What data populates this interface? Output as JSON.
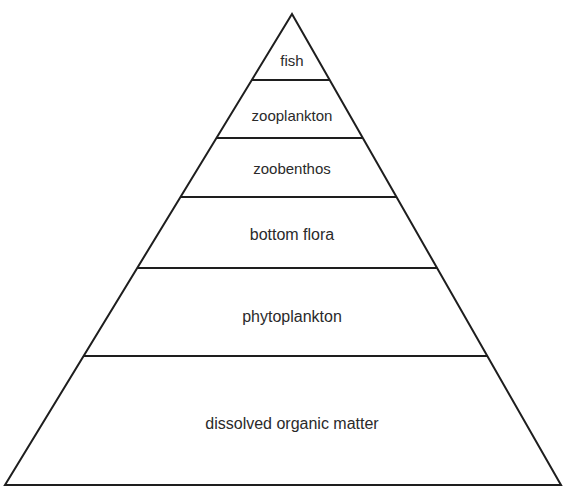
{
  "diagram": {
    "type": "pyramid",
    "apex": [
      292,
      14
    ],
    "base": {
      "y": 485,
      "left": 5,
      "right": 561
    },
    "line_color": "#1e1e1e",
    "levels": [
      {
        "label": "fish",
        "top": 14,
        "bottom": 80,
        "text_y": 66,
        "font_size": 15
      },
      {
        "label": "zooplankton",
        "top": 80,
        "bottom": 138,
        "text_y": 121,
        "font_size": 15
      },
      {
        "label": "zoobenthos",
        "top": 138,
        "bottom": 197,
        "text_y": 174,
        "font_size": 15
      },
      {
        "label": "bottom flora",
        "top": 197,
        "bottom": 268,
        "text_y": 240,
        "font_size": 16
      },
      {
        "label": "phytoplankton",
        "top": 268,
        "bottom": 356,
        "text_y": 322,
        "font_size": 16
      },
      {
        "label": "dissolved organic matter",
        "top": 356,
        "bottom": 485,
        "text_y": 429,
        "font_size": 16
      }
    ]
  }
}
